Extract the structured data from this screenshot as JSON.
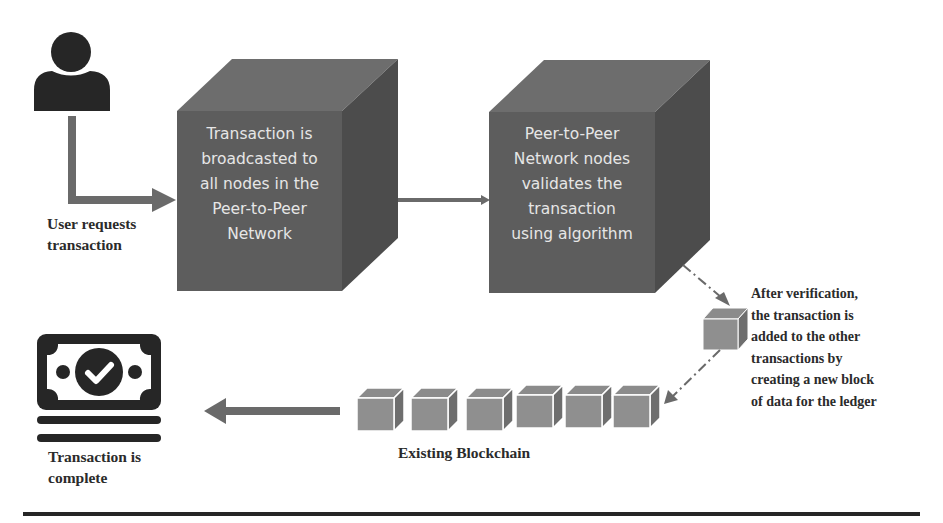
{
  "diagram": {
    "colors": {
      "arrow": "#6a6a6a",
      "icon": "#262626",
      "cube_front": "#5d5d5d",
      "cube_top": "#6d6d6d",
      "cube_side": "#4c4c4c",
      "block_front": "#8f8f8f",
      "block_top": "#8b8b8b",
      "block_side": "#6e6e6e",
      "text_dark": "#2b2b2b",
      "cube_text": "#e6e6e6"
    },
    "user": {
      "icon": "user-icon",
      "label_lines": [
        "User requests",
        "transaction"
      ]
    },
    "broadcast_cube": {
      "lines": [
        "Transaction is",
        "broadcasted to",
        "all nodes in the",
        "Peer-to-Peer",
        "Network"
      ]
    },
    "validate_cube": {
      "lines": [
        "Peer-to-Peer",
        "Network nodes",
        "validates the",
        "transaction",
        "using algorithm"
      ]
    },
    "new_block": {
      "label_lines": [
        "After verification,",
        "the transaction is",
        "added to the other",
        "transactions by",
        "creating a new block",
        "of data for the ledger"
      ]
    },
    "blockchain": {
      "label": "Existing Blockchain",
      "block_count": 6
    },
    "complete": {
      "icon": "money-check-icon",
      "label_lines": [
        "Transaction is",
        "complete"
      ]
    }
  }
}
